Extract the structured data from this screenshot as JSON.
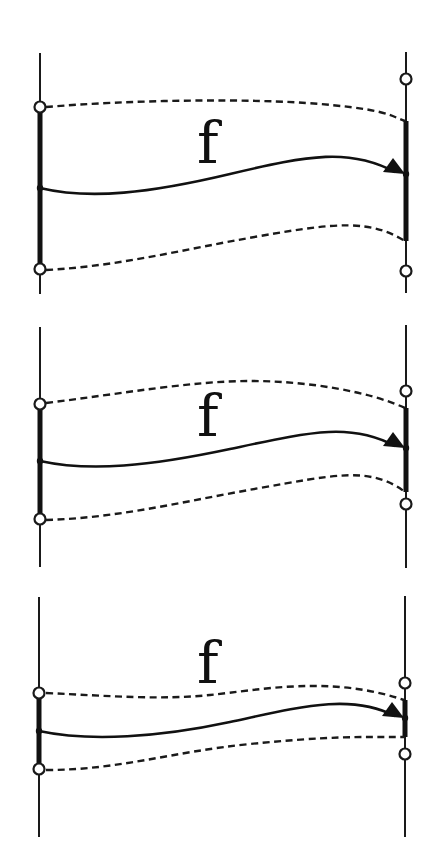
{
  "diagram": {
    "title": "",
    "colors": {
      "background": "#ffffff",
      "ink": "#111111"
    },
    "panels": [
      {
        "id": "panel-1",
        "label": "f",
        "label_pos": [
          197,
          163
        ],
        "left_axis": {
          "x": 40,
          "y1": 53,
          "y2": 294
        },
        "right_axis": {
          "x": 406,
          "y1": 52,
          "y2": 293
        },
        "left_interval": {
          "open_top": 107,
          "open_bottom": 269,
          "thick": [
            107,
            269
          ],
          "point": 188
        },
        "right_interval": {
          "open_top": 79,
          "open_bottom": 271,
          "thick": [
            121,
            241
          ],
          "point": 174
        },
        "curves": {
          "upper_dashed": "M46,107 C130,100 250,98 320,104 S390,116 405,121",
          "map": "M40,188 C90,200 150,193 230,174 S350,148 395,172",
          "lower_dashed": "M46,270 C120,266 180,250 260,236 S370,220 405,241"
        },
        "arrow_tip": [
          405,
          174
        ]
      },
      {
        "id": "panel-2",
        "label": "f",
        "label_pos": [
          197,
          436
        ],
        "left_axis": {
          "x": 40,
          "y1": 327,
          "y2": 567
        },
        "right_axis": {
          "x": 406,
          "y1": 325,
          "y2": 568
        },
        "left_interval": {
          "open_top": 404,
          "open_bottom": 519,
          "thick": [
            404,
            519
          ],
          "point": 461
        },
        "right_interval": {
          "open_top": 391,
          "open_bottom": 504,
          "thick": [
            408,
            492
          ],
          "point": 448
        },
        "curves": {
          "upper_dashed": "M46,403 C120,394 190,381 250,381 S370,392 405,408",
          "map": "M40,461 C90,472 150,466 230,449 S350,422 395,446",
          "lower_dashed": "M46,520 C120,518 190,500 260,488 S370,465 405,492"
        },
        "arrow_tip": [
          405,
          448
        ]
      },
      {
        "id": "panel-3",
        "label": "f",
        "label_pos": [
          197,
          683
        ],
        "left_axis": {
          "x": 39,
          "y1": 597,
          "y2": 837
        },
        "right_axis": {
          "x": 405,
          "y1": 596,
          "y2": 837
        },
        "left_interval": {
          "open_top": 693,
          "open_bottom": 769,
          "thick": [
            693,
            769
          ],
          "point": 731
        },
        "right_interval": {
          "open_top": 683,
          "open_bottom": 754,
          "thick": [
            700,
            737
          ],
          "point": 718
        },
        "curves": {
          "upper_dashed": "M46,693 C110,696 160,700 210,695 S330,675 404,700",
          "map": "M39,731 C90,742 160,737 230,722 S350,693 395,716",
          "lower_dashed": "M46,770 C120,770 170,752 250,744 S360,737 404,737"
        },
        "arrow_tip": [
          404,
          718
        ]
      }
    ]
  }
}
